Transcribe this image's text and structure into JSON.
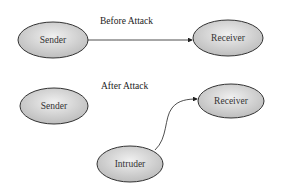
{
  "sections": {
    "before": {
      "title": "Before Attack"
    },
    "after": {
      "title": "After Attack"
    }
  },
  "nodes": {
    "sender_before": {
      "label": "Sender"
    },
    "receiver_before": {
      "label": "Receiver"
    },
    "sender_after": {
      "label": "Sender"
    },
    "receiver_after": {
      "label": "Receiver"
    },
    "intruder": {
      "label": "Intruder"
    }
  },
  "colors": {
    "node_fill_light": "#eeeeee",
    "node_fill_dark": "#bdbdbd",
    "node_stroke": "#333333",
    "edge": "#222222"
  }
}
